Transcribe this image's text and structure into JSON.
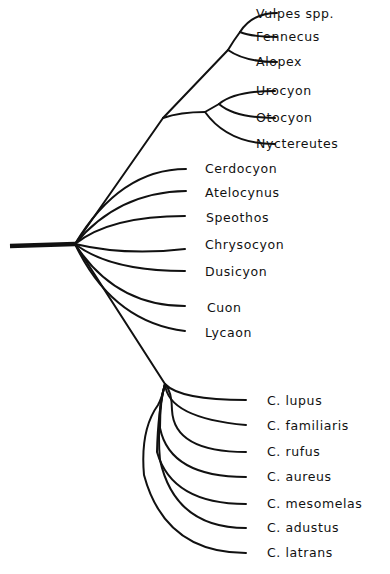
{
  "diagram": {
    "type": "phylogenetic-tree",
    "root": "Canidae",
    "clades": {
      "vulpine": {
        "taxa": [
          "Vulpes spp.",
          "Fennecus",
          "Alopex"
        ]
      },
      "urocyon_group": {
        "taxa": [
          "Urocyon",
          "Otocyon",
          "Nyctereutes"
        ]
      },
      "south_american_and_others": {
        "taxa": [
          "Cerdocyon",
          "Atelocynus",
          "Speothos",
          "Chrysocyon",
          "Dusicyon",
          "Cuon",
          "Lycaon"
        ]
      },
      "canis": {
        "taxa": [
          "C. lupus",
          "C. familiaris",
          "C. rufus",
          "C. aureus",
          "C. mesomelas",
          "C. adustus",
          "C. latrans"
        ]
      }
    }
  },
  "labels": {
    "vulpes": "Vulpes spp.",
    "fennecus": "Fennecus",
    "alopex": "Alopex",
    "urocyon": "Urocyon",
    "otocyon": "Otocyon",
    "nyctereutes": "Nyctereutes",
    "cerdocyon": "Cerdocyon",
    "atelocynus": "Atelocynus",
    "speothos": "Speothos",
    "chrysocyon": "Chrysocyon",
    "dusicyon": "Dusicyon",
    "cuon": "Cuon",
    "lycaon": "Lycaon",
    "c_lupus": "C. lupus",
    "c_familiaris": "C. familiaris",
    "c_rufus": "C. rufus",
    "c_aureus": "C. aureus",
    "c_mesomelas": "C. mesomelas",
    "c_adustus": "C. adustus",
    "c_latrans": "C. latrans"
  },
  "colors": {
    "line": "#111111",
    "background": "#ffffff"
  }
}
